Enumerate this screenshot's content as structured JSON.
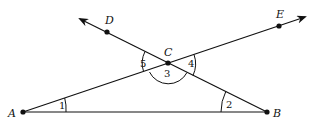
{
  "figure": {
    "points": {
      "A": {
        "label": "A",
        "x": 23,
        "y": 112
      },
      "B": {
        "label": "B",
        "x": 267,
        "y": 112
      },
      "C": {
        "label": "C",
        "x": 168,
        "y": 63
      },
      "D": {
        "label": "D",
        "x": 107,
        "y": 32
      },
      "E": {
        "label": "E",
        "x": 279,
        "y": 26
      }
    },
    "angles": {
      "a1": "1",
      "a2": "2",
      "a3": "3",
      "a4": "4",
      "a5": "5"
    },
    "stroke_color": "#111111"
  }
}
